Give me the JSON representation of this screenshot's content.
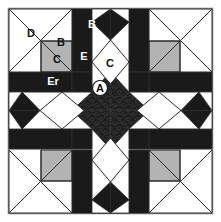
{
  "figure": {
    "name": "quilt-block-diagram",
    "width": 221,
    "height": 222
  },
  "colors": {
    "background": "#ffffff",
    "frame": "#8c8c8c",
    "dark": "#1a1a1a",
    "dark_textured": "#1f1f1f",
    "gray": "#b3b3b3",
    "white": "#ffffff",
    "outline": "#2b2b2b",
    "label_dark": "#111111",
    "label_light": "#ffffff"
  },
  "labels": [
    {
      "id": "d-corner",
      "text": "D",
      "x": 31,
      "y": 33,
      "tone": "dark"
    },
    {
      "id": "b-corner",
      "text": "B",
      "x": 61,
      "y": 42,
      "tone": "dark"
    },
    {
      "id": "b-top",
      "text": "B",
      "x": 92,
      "y": 24,
      "tone": "light"
    },
    {
      "id": "c-square",
      "text": "C",
      "x": 57,
      "y": 59,
      "tone": "dark"
    },
    {
      "id": "e-wedge",
      "text": "E",
      "x": 84,
      "y": 56,
      "tone": "light"
    },
    {
      "id": "a-top",
      "text": "A",
      "x": 101,
      "y": 39,
      "tone": "light"
    },
    {
      "id": "c-diamond",
      "text": "C",
      "x": 110,
      "y": 63,
      "tone": "dark"
    },
    {
      "id": "er-wedge",
      "text": "Er",
      "x": 53,
      "y": 81,
      "tone": "light"
    },
    {
      "id": "a-center",
      "text": "A",
      "x": 100,
      "y": 88,
      "tone": "dark"
    }
  ],
  "badges": [
    {
      "id": "a-center-badge",
      "cx": 100,
      "cy": 88,
      "r": 7.5
    }
  ],
  "legend_pieces": [
    {
      "code": "A",
      "description": "center star point patch"
    },
    {
      "code": "B",
      "description": "small corner triangle"
    },
    {
      "code": "C",
      "description": "corner square / center diamond"
    },
    {
      "code": "D",
      "description": "large corner triangle"
    },
    {
      "code": "E",
      "description": "long wedge"
    },
    {
      "code": "Er",
      "description": "long wedge reversed"
    }
  ]
}
